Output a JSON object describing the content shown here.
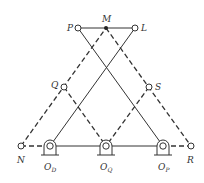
{
  "diagram": {
    "type": "linkage-mechanism",
    "colors": {
      "line": "#333333",
      "background": "#ffffff"
    },
    "points": {
      "P": {
        "label": "P",
        "x": 78,
        "y": 28
      },
      "M": {
        "label": "M",
        "x": 106,
        "y": 28
      },
      "L": {
        "label": "L",
        "x": 135,
        "y": 28
      },
      "Q": {
        "label": "Q",
        "x": 64,
        "y": 87
      },
      "S": {
        "label": "S",
        "x": 149,
        "y": 87
      },
      "N": {
        "label": "N",
        "x": 21,
        "y": 146
      },
      "OD": {
        "label": "O",
        "sub": "D",
        "x": 50,
        "y": 146
      },
      "OQ": {
        "label": "O",
        "sub": "Q",
        "x": 106,
        "y": 146
      },
      "OP": {
        "label": "O",
        "sub": "P",
        "x": 163,
        "y": 146
      },
      "R": {
        "label": "R",
        "x": 191,
        "y": 146
      }
    },
    "solid_links": [
      [
        "P",
        "L"
      ],
      [
        "OD",
        "OP"
      ],
      [
        "OD",
        "L"
      ],
      [
        "OP",
        "P"
      ]
    ],
    "dashed_links": [
      [
        "N",
        "M"
      ],
      [
        "M",
        "R"
      ],
      [
        "N",
        "OD"
      ],
      [
        "OP",
        "R"
      ],
      [
        "Q",
        "OQ"
      ],
      [
        "S",
        "OQ"
      ]
    ]
  }
}
